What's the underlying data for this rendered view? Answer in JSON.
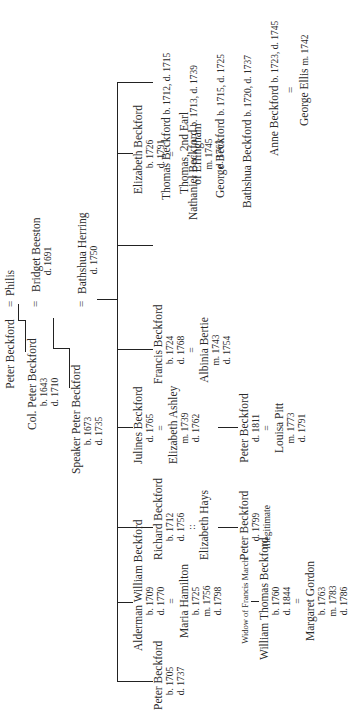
{
  "generation0": {
    "peter": {
      "name": "Peter Beckford"
    },
    "marriage": "=",
    "spouse": {
      "name": "Philis"
    }
  },
  "generation1": {
    "colonel": {
      "name": "Col. Peter Beckford",
      "born": "b. 1643",
      "died": "d. 1710"
    },
    "marriage": "=",
    "spouse": {
      "name": "Bridget Beeston",
      "died": "d. 1691"
    }
  },
  "generation2": {
    "speaker": {
      "name": "Speaker Peter Beckford",
      "born": "b. 1673",
      "died": "d. 1735"
    },
    "marriage": "=",
    "spouse": {
      "name": "Bathshua Herring",
      "died": "d. 1750"
    }
  },
  "children": {
    "peter": {
      "name": "Peter Beckford",
      "born": "b. 1705",
      "died": "d. 1737"
    },
    "alderman": {
      "name": "Alderman William Beckford",
      "born": "b. 1709",
      "died": "d. 1770",
      "marriage": "=",
      "spouse": {
        "name": "Maria Hamilton",
        "born": "b. 1725",
        "married": "m. 1756",
        "died": "d. 1798",
        "note": "Widow of Francis March"
      },
      "child": {
        "name": "William Thomas Beckford",
        "born": "b. 1760",
        "died": "d. 1844",
        "marriage": "=",
        "spouse": {
          "name": "Margaret Gordon",
          "born": "b. 1763",
          "married": "m. 1783",
          "died": "d. 1786"
        }
      }
    },
    "richard": {
      "name": "Richard Beckford",
      "born": "b. 1712",
      "died": "d. 1756",
      "marriage": "::",
      "spouse": {
        "name": "Elizabeth Hays"
      },
      "child": {
        "name": "Peter Beckford",
        "died": "d. 1799",
        "note": "Illegitimate"
      }
    },
    "julines": {
      "name": "Julines Beckford",
      "died": "d. 1765",
      "marriage": "=",
      "spouse": {
        "name": "Elizabeth Ashley",
        "married": "m. 1739",
        "died": "d. 1762"
      },
      "child": {
        "name": "Peter Beckford",
        "died": "d. 1811",
        "marriage": "=",
        "spouse": {
          "name": "Louisa Pitt",
          "married": "m. 1773",
          "died": "d. 1791"
        }
      }
    },
    "francis": {
      "name": "Francis Beckford",
      "born": "b. 1724",
      "died": "d. 1768",
      "marriage": "=",
      "spouse": {
        "name": "Albinia Bertie",
        "married": "m. 1743",
        "died": "d. 1754"
      }
    },
    "elizabeth": {
      "name": "Elizabeth Beckford",
      "born": "b. 1726",
      "died": "d. 1791",
      "marriage": "=",
      "spouse": {
        "name": "Thomas, 2nd Earl",
        "name2": "of Effingham",
        "married": "m. 1745",
        "died": "d. 1763"
      }
    },
    "others": [
      {
        "name": "Thomas Beckford",
        "dates": "b. 1712, d. 1715"
      },
      {
        "name": "Nathaniel Beckford",
        "dates": "b. 1713, d. 1739"
      },
      {
        "name": "George Beckford",
        "dates": "b. 1715, d. 1725"
      },
      {
        "name": "Bathshua Beckford",
        "dates": "b. 1720, d. 1737"
      },
      {
        "name": "Anne Beckford",
        "dates": "b. 1723, d. 1745"
      }
    ],
    "anne_marriage": "=",
    "anne_spouse": {
      "name": "George Ellis",
      "married": "m. 1742"
    }
  }
}
